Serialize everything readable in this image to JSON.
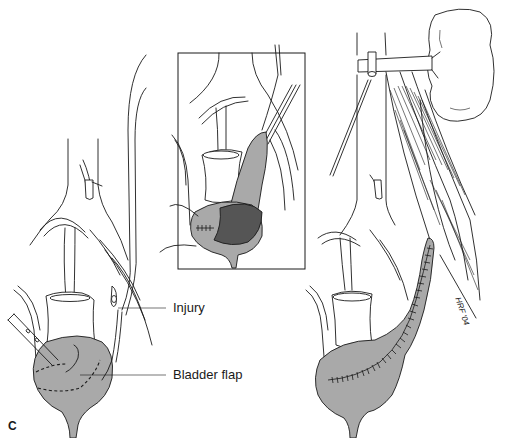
{
  "figure": {
    "panel_letter": "C",
    "labels": {
      "injury": "Injury",
      "bladder_flap": "Bladder flap"
    },
    "signature": "HRF '04",
    "panels": [
      {
        "id": "left",
        "description": "Ureteral injury with bladder flap outlined (dashed line) and scissors"
      },
      {
        "id": "inset",
        "description": "Boxed inset: flap raised from bladder, mucosa shown darker"
      },
      {
        "id": "right",
        "description": "Tubularized bladder flap sutured up toward the kidney along psoas"
      }
    ],
    "colors": {
      "bladder_fill": "#a9a9a9",
      "mucosa_fill": "#555555",
      "line": "#1a1a1a",
      "background": "#ffffff"
    }
  }
}
